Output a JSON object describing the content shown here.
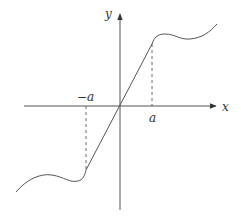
{
  "diagram": {
    "axes": {
      "x_label": "x",
      "y_label": "y"
    },
    "ticks": {
      "neg_a": "−a",
      "pos_a": "a"
    },
    "colors": {
      "stroke": "#555555",
      "text": "#333333",
      "background": "#ffffff"
    }
  }
}
